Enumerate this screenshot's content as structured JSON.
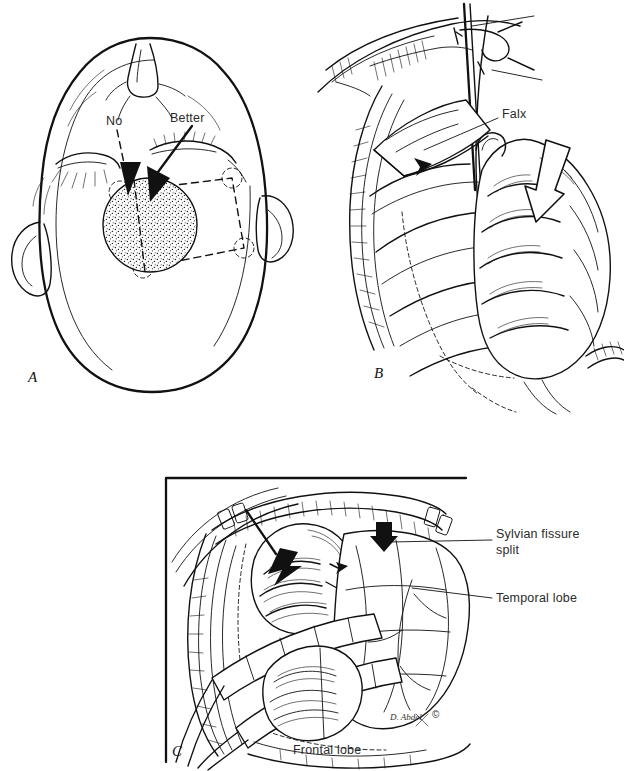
{
  "figure": {
    "type": "surgical-technique-line-illustration",
    "background": "#ffffff",
    "ink_color": "#111111",
    "panel_count": 3
  },
  "panels": [
    {
      "letter": "A",
      "name": "head-vertex-view-craniotomy-planning",
      "description": "Superior (vertex) view of the head showing nose, closed eyes and ears, with a stippled round lesion and a dashed craniotomy flap outline with corner burr holes",
      "annotations": [
        {
          "text": "No",
          "arrow_style": "dashed",
          "meaning": "suboptimal trajectory"
        },
        {
          "text": "Better",
          "arrow_style": "solid",
          "meaning": "preferred trajectory"
        }
      ],
      "features": [
        "stippled-lesion",
        "dashed-craniotomy-flap",
        "burr-holes",
        "nose",
        "eyes",
        "ears"
      ]
    },
    {
      "letter": "B",
      "name": "interhemispheric-operative-view",
      "description": "Operative exposure with retracted scalp, dural flap and brain surface; a large open block arrow indicates the retraction direction and a small solid arrow marks the dissection plane",
      "annotations": [
        {
          "text": "Falx",
          "leader": true
        }
      ],
      "features": [
        "scalp-edge-hatching",
        "retractor-hooks",
        "dural-flap",
        "gyri",
        "block-arrow",
        "solid-arrow",
        "instrument-shaft"
      ]
    },
    {
      "letter": "C",
      "name": "pterional-operative-view",
      "description": "Operative exposure through a pterional craniotomy with the sylvian fissure split and brain retractors on the frontal and temporal lobes",
      "annotations": [
        {
          "text": "Sylvian fissure",
          "text2": "split",
          "leader": true
        },
        {
          "text": "Temporal lobe",
          "leader": true
        },
        {
          "text": "Frontal lobe",
          "leader": true
        }
      ],
      "features": [
        "craniotomy-edge",
        "scalp-clips",
        "retractor-blades",
        "gyri",
        "arrows",
        "frame-border"
      ],
      "border": {
        "left": true,
        "top": true,
        "color": "#111111"
      }
    }
  ],
  "labels": {
    "no": "No",
    "better": "Better",
    "falx": "Falx",
    "sylvian_line1": "Sylvian fissure",
    "sylvian_line2": "split",
    "temporal": "Temporal lobe",
    "frontal": "Frontal lobe",
    "panel_a": "A",
    "panel_b": "B",
    "panel_c": "C"
  },
  "credit": {
    "signature": "D. Abdel",
    "copyright": "©"
  }
}
